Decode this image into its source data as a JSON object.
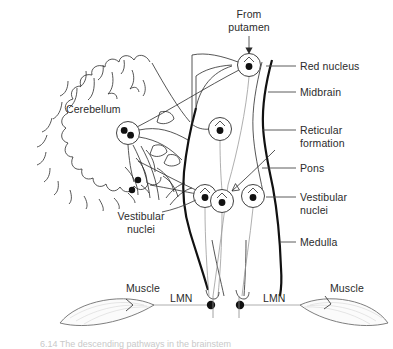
{
  "figure": {
    "domain": "Diagram",
    "background_color": "#ffffff",
    "ink_color": "#2b2b2b",
    "caption_text": "6.14  The descending pathways in the brainstem"
  },
  "labels": {
    "from_putamen": "From\nputamen",
    "cerebellum": "Cerebellum",
    "red_nucleus": "Red nucleus",
    "midbrain": "Midbrain",
    "reticular_formation": "Reticular\nformation",
    "pons": "Pons",
    "vestibular_nuclei_right": "Vestibular\nnuclei",
    "medulla": "Medulla",
    "vestibular_nuclei_left": "Vestibular\nnuclei",
    "muscle_left": "Muscle",
    "muscle_right": "Muscle",
    "lmn_left": "LMN",
    "lmn_right": "LMN"
  },
  "label_positions": {
    "from_putamen": {
      "x": 236,
      "y": 10
    },
    "cerebellum": {
      "x": 68,
      "y": 104
    },
    "red_nucleus": {
      "x": 300,
      "y": 62
    },
    "midbrain": {
      "x": 300,
      "y": 88
    },
    "reticular_formation": {
      "x": 300,
      "y": 126
    },
    "pons": {
      "x": 300,
      "y": 164
    },
    "vestibular_nuclei_right": {
      "x": 300,
      "y": 193
    },
    "medulla": {
      "x": 300,
      "y": 238
    },
    "vestibular_nuclei_left": {
      "x": 123,
      "y": 212
    },
    "muscle_left": {
      "x": 128,
      "y": 283
    },
    "muscle_right": {
      "x": 332,
      "y": 283
    },
    "lmn_left": {
      "x": 172,
      "y": 294
    },
    "lmn_right": {
      "x": 265,
      "y": 294
    }
  },
  "neurons": [
    {
      "name": "red-nucleus-neuron",
      "cx": 249,
      "cy": 65,
      "r": 11.5,
      "somas": 1
    },
    {
      "name": "reticular-formation-neuron",
      "cx": 220,
      "cy": 129,
      "r": 11.5,
      "somas": 1
    },
    {
      "name": "deep-cerebellar-nuclei",
      "cx": 128,
      "cy": 133,
      "r": 11.5,
      "somas": 2
    },
    {
      "name": "vestibular-nucleus-left",
      "cx": 205,
      "cy": 196,
      "r": 11.5,
      "somas": 1
    },
    {
      "name": "vestibular-nucleus-mid",
      "cx": 222,
      "cy": 201,
      "r": 11.5,
      "somas": 1
    },
    {
      "name": "vestibular-nucleus-right",
      "cx": 253,
      "cy": 196,
      "r": 11.5,
      "somas": 1
    }
  ],
  "motor_endings": [
    {
      "name": "lmn-soma-left",
      "cx": 211,
      "cy": 305
    },
    {
      "name": "lmn-soma-right",
      "cx": 240,
      "cy": 305
    }
  ],
  "colors": {
    "ink": "#2b2b2b",
    "thick_outline": "#111111",
    "muscle_fill": "#fbfbfb",
    "muscle_stroke": "#6f6f6f",
    "leader_line": "#4a4a4a",
    "pathway_line": "#9a9a9a",
    "caption": "#c9c9c9"
  },
  "structures": [
    "Cerebellum",
    "Midbrain",
    "Pons",
    "Medulla",
    "Red nucleus",
    "Reticular formation",
    "Vestibular nuclei",
    "Lower motor neuron (LMN)",
    "Skeletal muscle"
  ]
}
